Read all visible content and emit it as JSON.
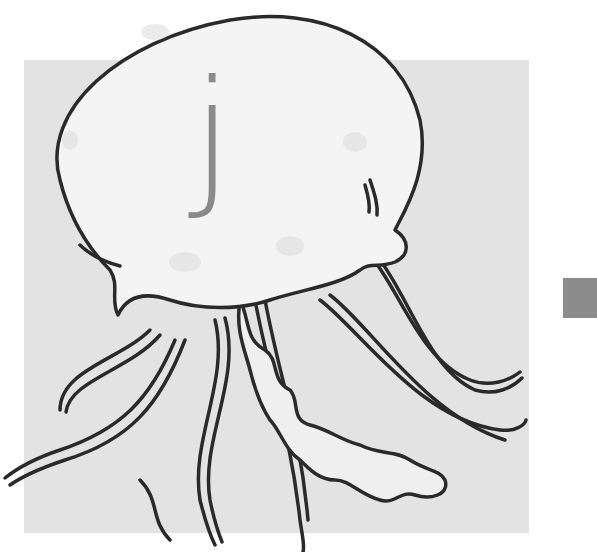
{
  "card": {
    "letter": "j",
    "subject": "jellyfish",
    "colors": {
      "background": "#ffffff",
      "panel": "#e3e3e3",
      "side_square": "#8c8c8c",
      "letter": "#8a8a8a",
      "outline": "#2a2a2a",
      "bell_fill": "#f4f4f4"
    }
  }
}
